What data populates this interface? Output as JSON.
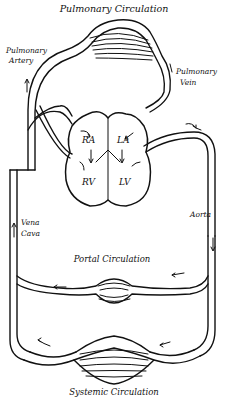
{
  "title": "Pulmonary Circulation",
  "labels": {
    "pulmonary_artery_1": "Pulmonary",
    "pulmonary_artery_2": "Artery",
    "pulmonary_vein_1": "Pulmonary",
    "pulmonary_vein_2": "Vein",
    "right_atrium": "RA",
    "left_atrium": "LA",
    "right_ventricle": "RV",
    "left_ventricle": "LV",
    "vena_cava_1": "Vena",
    "vena_cava_2": "Cava",
    "aorta": "Aorta",
    "portal": "Portal Circulation",
    "systemic": "Systemic Circulation"
  },
  "colors": {
    "ink": "#111111",
    "paper": "#ffffff"
  }
}
